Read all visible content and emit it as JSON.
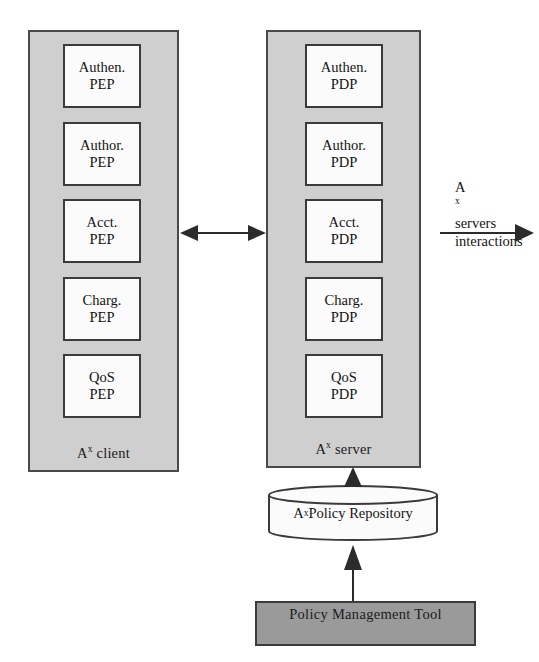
{
  "diagram": {
    "colors": {
      "panel_fill": "#cfcfcf",
      "node_fill": "#fbfbfb",
      "tool_fill": "#9a9a9a",
      "stroke": "#3b3b3b",
      "background": "#ffffff"
    },
    "client_panel": {
      "label_prefix": "A",
      "label_sup": "x",
      "label_suffix": " client",
      "nodes": [
        {
          "line1": "Authen.",
          "line2": "PEP"
        },
        {
          "line1": "Author.",
          "line2": "PEP"
        },
        {
          "line1": "Acct.",
          "line2": "PEP"
        },
        {
          "line1": "Charg.",
          "line2": "PEP"
        },
        {
          "line1": "QoS",
          "line2": "PEP"
        }
      ]
    },
    "server_panel": {
      "label_prefix": "A",
      "label_sup": "x",
      "label_suffix": " server",
      "nodes": [
        {
          "line1": "Authen.",
          "line2": "PDP"
        },
        {
          "line1": "Author.",
          "line2": "PDP"
        },
        {
          "line1": "Acct.",
          "line2": "PDP"
        },
        {
          "line1": "Charg.",
          "line2": "PDP"
        },
        {
          "line1": "QoS",
          "line2": "PDP"
        }
      ]
    },
    "repository": {
      "label_prefix": "A",
      "label_sup": "x",
      "label_suffix": " Policy Repository"
    },
    "tool": {
      "label": "Policy Management Tool"
    },
    "servers_caption": {
      "line1_prefix": "A",
      "line1_sup": "x",
      "line1_suffix": " servers",
      "line2": "interactions"
    },
    "connectors": [
      {
        "name": "client-server-bidirectional-arrow",
        "kind": "double-arrow",
        "orientation": "horizontal"
      },
      {
        "name": "server-external-arrow",
        "kind": "single-arrow",
        "orientation": "horizontal-right"
      },
      {
        "name": "repository-to-server-arrow",
        "kind": "single-arrow",
        "orientation": "vertical-up"
      },
      {
        "name": "tool-to-repository-arrow",
        "kind": "single-arrow",
        "orientation": "vertical-up"
      }
    ]
  }
}
